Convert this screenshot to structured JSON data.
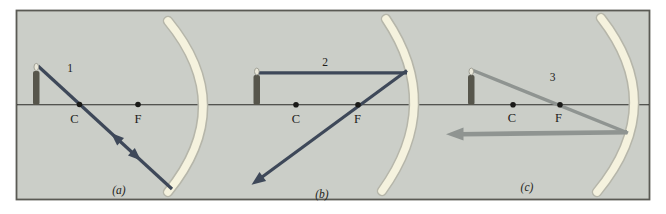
{
  "colors": {
    "page_background": "#ffffff",
    "panel_background": "#cbcec8",
    "frame_border": "#5a5a54",
    "optical_axis": "#2b2b28",
    "mirror_fill": "#f5f2de",
    "mirror_edge": "#b6b6aa",
    "ray_dark_blue": "#3e4859",
    "ray_gray": "#8f9491",
    "candle": "#57564c",
    "point_dot": "#1a1a18"
  },
  "panels": [
    {
      "panel_label": "(a)",
      "ray_label": "1",
      "center_label": "C",
      "focus_label": "F"
    },
    {
      "panel_label": "(b)",
      "ray_label": "2",
      "center_label": "C",
      "focus_label": "F"
    },
    {
      "panel_label": "(c)",
      "ray_label": "3",
      "center_label": "C",
      "focus_label": "F"
    }
  ]
}
